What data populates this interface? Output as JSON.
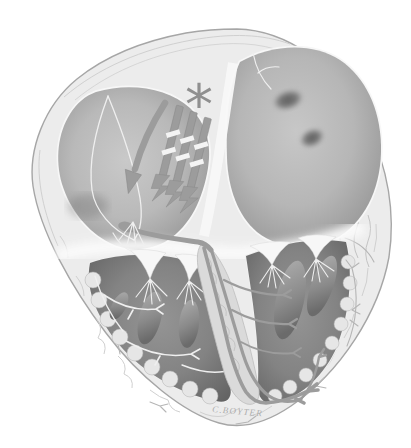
{
  "figure": {
    "kind": "anatomical-illustration",
    "annotations": {
      "asterisk_marker": "*",
      "conduction_arrow_count": 4
    },
    "signature": "C.BOYTER",
    "parts": [
      "right-atrium",
      "left-atrium",
      "right-ventricle",
      "left-ventricle",
      "interatrial-septum",
      "interventricular-septum",
      "av-node",
      "his-bundle",
      "right-bundle-branch",
      "left-bundle-branch",
      "purkinje-fibers",
      "tricuspid-valve",
      "mitral-valve",
      "papillary-muscles",
      "chordae-tendineae",
      "pulmonary-vein-openings",
      "epicardium"
    ]
  },
  "colors": {
    "background": "#ffffff",
    "heart_wall": "#ececec",
    "wall_outline": "#a6a6a6",
    "atrium_fill": "#b7b7b7",
    "ventricle_fill": "#7d7d7d",
    "endocardium_white": "#f8f8f8",
    "conduction_gray": "#9c9c9c",
    "annotation_gray": "#8f8f8f",
    "signature_gray": "#adadad"
  }
}
